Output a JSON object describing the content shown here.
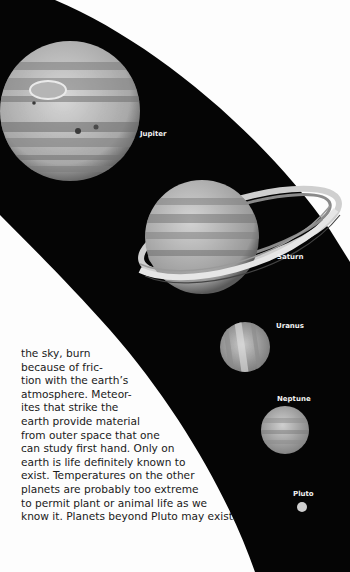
{
  "planets": [
    {
      "name": "Jupiter",
      "label": "Jupiter"
    },
    {
      "name": "Saturn",
      "label": "Saturn"
    },
    {
      "name": "Uranus",
      "label": "Uranus"
    },
    {
      "name": "Neptune",
      "label": "Neptune"
    },
    {
      "name": "Pluto",
      "label": "Pluto"
    }
  ],
  "body_text": {
    "lines": [
      "the sky, burn",
      "because of fric-",
      "tion with the earth’s",
      "atmosphere. Meteor-",
      "ites that strike the",
      "earth provide material",
      "from outer space that one",
      "can study first hand. Only on",
      "earth is life definitely known to",
      "exist. Temperatures on the other",
      "planets are probably too extreme",
      "to permit plant or animal life as we",
      "know it. Planets beyond Pluto may exist."
    ]
  },
  "colors": {
    "space": "#050505",
    "page": "#fdfdfd",
    "label": "#f2f2f2",
    "text": "#1a1a1a"
  }
}
